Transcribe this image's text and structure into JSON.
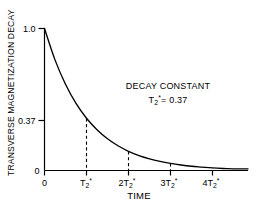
{
  "chart_data": {
    "type": "line",
    "title": "",
    "xlabel": "TIME",
    "ylabel": "TRANSVERSE MAGNETIZATION DECAY",
    "x_tick_labels": [
      "0",
      "T2*",
      "2T2*",
      "3T2*",
      "4T2*"
    ],
    "x_tick_values": [
      0,
      1,
      2,
      3,
      4
    ],
    "y_tick_labels": [
      "1.0",
      "0.37",
      "0"
    ],
    "y_tick_values": [
      1.0,
      0.37,
      0
    ],
    "xlim": [
      0,
      4.6
    ],
    "ylim": [
      0,
      1.0
    ],
    "grid": false,
    "legend": false,
    "series": [
      {
        "name": "transverse magnetization decay",
        "equation": "exp(-t / T2*)",
        "x": [
          0,
          0.25,
          0.5,
          0.75,
          1,
          1.25,
          1.5,
          1.75,
          2,
          2.25,
          2.5,
          2.75,
          3,
          3.25,
          3.5,
          3.75,
          4,
          4.25,
          4.5
        ],
        "values": [
          1.0,
          0.779,
          0.607,
          0.472,
          0.368,
          0.287,
          0.223,
          0.174,
          0.135,
          0.105,
          0.082,
          0.064,
          0.05,
          0.039,
          0.03,
          0.024,
          0.018,
          0.014,
          0.011
        ]
      }
    ],
    "annotations": [
      {
        "id": "decay-constant-title",
        "text": "DECAY CONSTANT"
      },
      {
        "id": "decay-constant-value",
        "symbol": "T2*",
        "text": "= 0.37"
      }
    ],
    "dropline_markers": [
      {
        "x_label": "T2*",
        "x": 1,
        "y": 0.368
      },
      {
        "x_label": "2T2*",
        "x": 2,
        "y": 0.135
      },
      {
        "x_label": "3T2*",
        "x": 3,
        "y": 0.05
      }
    ],
    "colors": {
      "curve": "#000000",
      "axis": "#000000",
      "dashed": "#000000",
      "background": "#ffffff"
    }
  },
  "axis": {
    "x_title": "TIME",
    "y_title": "TRANSVERSE MAGNETIZATION DECAY",
    "y_ticks": {
      "top": "1.0",
      "mid": "0.37",
      "bottom": "0"
    },
    "x_ticks": {
      "t0": "0",
      "t1_base": "T",
      "t1_sub": "2",
      "t1_sup": "*",
      "t2_base": "2T",
      "t2_sub": "2",
      "t2_sup": "*",
      "t3_base": "3T",
      "t3_sub": "2",
      "t3_sup": "*",
      "t4_base": "4T",
      "t4_sub": "2",
      "t4_sup": "*"
    }
  },
  "annotation": {
    "line1": "DECAY CONSTANT",
    "line2_base": "T",
    "line2_sub": "2",
    "line2_sup": "*",
    "line2_rest": "= 0.37"
  }
}
